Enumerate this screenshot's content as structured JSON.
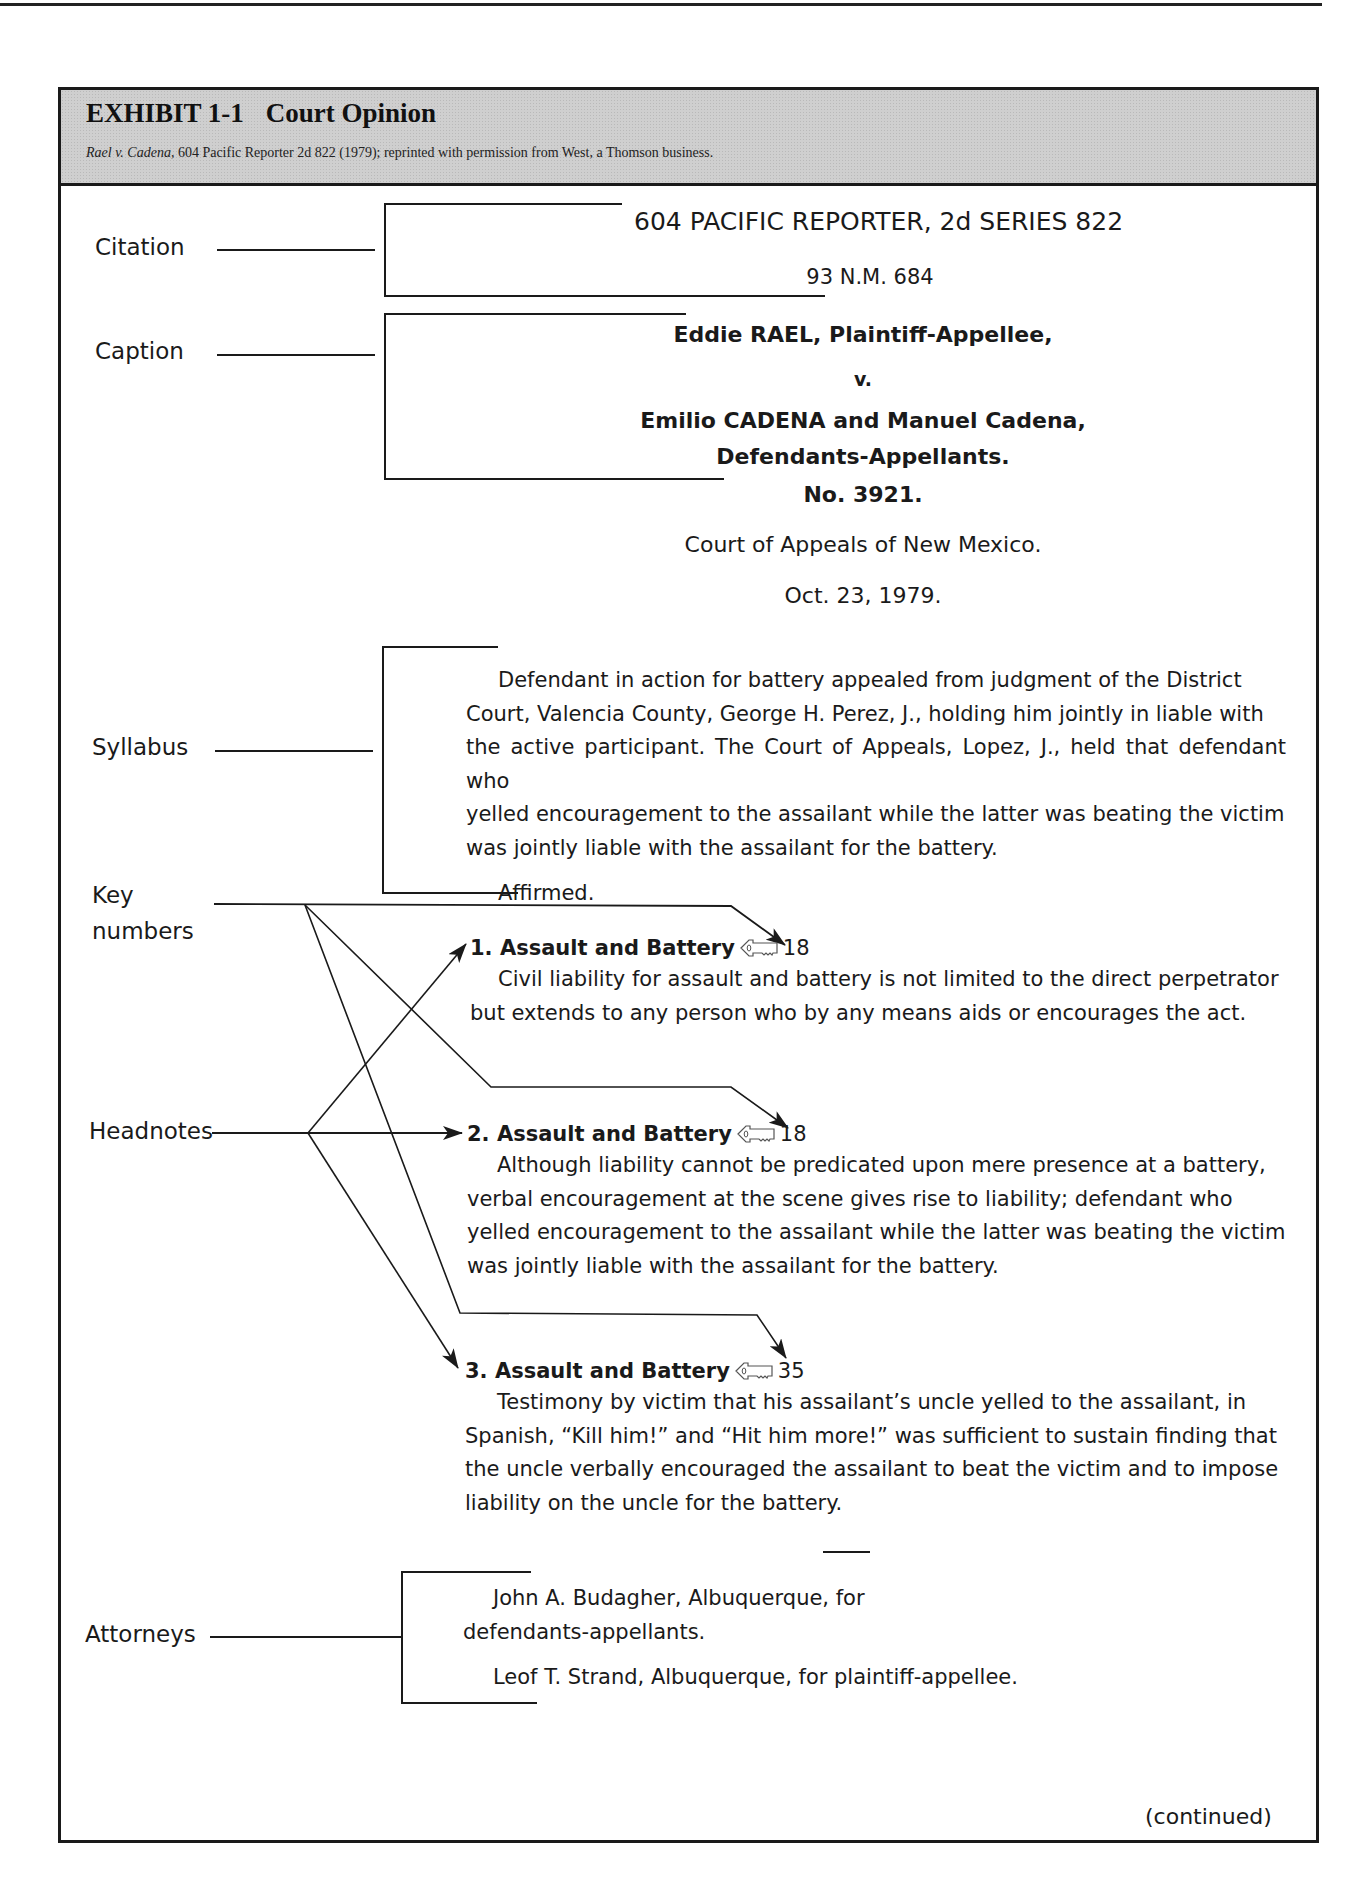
{
  "exhibit": {
    "number": "EXHIBIT 1-1",
    "title": "Court Opinion",
    "source_case_italic": "Rael v. Cadena,",
    "source_rest": " 604 Pacific Reporter 2d 822 (1979); reprinted with permission from West, a Thomson business."
  },
  "labels": {
    "citation": "Citation",
    "caption": "Caption",
    "syllabus": "Syllabus",
    "key_numbers_line1": "Key",
    "key_numbers_line2": "numbers",
    "headnotes": "Headnotes",
    "attorneys": "Attorneys"
  },
  "citation": {
    "reporter": "604 PACIFIC REPORTER, 2d SERIES 822",
    "official": "93 N.M. 684"
  },
  "caption": {
    "plaintiff": "Eddie RAEL, Plaintiff-Appellee,",
    "versus": "v.",
    "defendants": "Emilio CADENA and Manuel Cadena,",
    "defendants_role": "Defendants-Appellants.",
    "docket": "No. 3921.",
    "court": "Court of Appeals of New Mexico.",
    "date": "Oct. 23, 1979."
  },
  "syllabus": {
    "lines": [
      "Defendant in action for battery appealed from judgment of the District",
      "Court, Valencia County, George H. Perez, J., holding him jointly in liable with",
      "the active participant. The Court of Appeals, Lopez, J., held that defendant who",
      "yelled encouragement to the assailant while the latter was beating the victim",
      "was jointly liable with the assailant for the battery."
    ],
    "disposition": "Affirmed."
  },
  "headnotes": [
    {
      "number": "1.",
      "topic": "Assault and Battery",
      "key_icon": "west-key-icon",
      "key_number": "18",
      "lines": [
        "Civil liability for assault and battery is not limited to the direct perpetrator",
        "but extends to any person who by any means aids or encourages the act."
      ]
    },
    {
      "number": "2.",
      "topic": "Assault and Battery",
      "key_icon": "west-key-icon",
      "key_number": "18",
      "lines": [
        "Although liability cannot be predicated upon mere presence at a battery,",
        "verbal encouragement at the scene gives rise to liability; defendant who",
        "yelled encouragement to the assailant while the latter was beating the victim",
        "was jointly liable with the assailant for the battery."
      ]
    },
    {
      "number": "3.",
      "topic": "Assault and Battery",
      "key_icon": "west-key-icon",
      "key_number": "35",
      "lines": [
        "Testimony by victim that his assailant’s uncle yelled to the assailant, in",
        "Spanish, “Kill him!” and “Hit him more!” was sufficient to sustain finding that",
        "the uncle verbally encouraged the assailant to beat the victim and to impose",
        "liability on the uncle for the battery."
      ]
    }
  ],
  "attorneys": {
    "defense_line1": "John A. Budagher, Albuquerque, for",
    "defense_line2": "defendants-appellants.",
    "plaintiff": "Leof T. Strand, Albuquerque, for plaintiff-appellee."
  },
  "footer": {
    "continued": "(continued)"
  },
  "colors": {
    "header_bar": "#cfcfcf",
    "ink": "#1a1a1a"
  }
}
